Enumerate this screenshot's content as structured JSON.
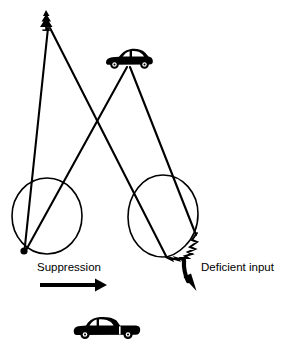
{
  "figure": {
    "background_color": "#ffffff",
    "stroke_color": "#000000",
    "labels": {
      "suppression": "Suppression",
      "deficient_input": "Deficient input"
    },
    "objects": {
      "tree_icon": "tree-icon",
      "upper_car_icon": "car-icon",
      "lower_car_icon": "car-icon",
      "left_eye": "eye-circle",
      "right_eye": "eye-circle",
      "fovea_marker": "fovea-dot",
      "scotoma": "zigzag-scotoma",
      "suppression_arrow": "right-arrow",
      "deficient_arrow": "curved-down-arrow"
    },
    "geometry": {
      "tree_apex": [
        48,
        28
      ],
      "car_origin": [
        128,
        67
      ],
      "left_circle": {
        "cx": 47,
        "cy": 216,
        "rx": 35,
        "ry": 38
      },
      "right_circle": {
        "cx": 163,
        "cy": 216,
        "rx": 35,
        "ry": 41
      },
      "fovea_point": [
        24,
        251
      ],
      "scotoma_start": [
        197,
        234
      ],
      "scotoma_end": [
        166,
        256
      ]
    }
  }
}
